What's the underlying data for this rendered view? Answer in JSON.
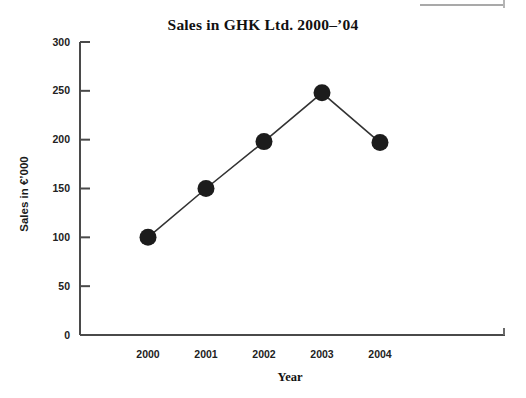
{
  "figure": {
    "background": "#ffffff",
    "ink_color": "#1a1a1a"
  },
  "scan_artifact": {
    "name": "page-edge-rule",
    "color": "#a9a9a9"
  },
  "chart_data": {
    "type": "line",
    "title": "Sales in GHK Ltd. 2000–’04",
    "xlabel": "Year",
    "ylabel": "Sales in €’000",
    "categories": [
      "2000",
      "2001",
      "2002",
      "2003",
      "2004"
    ],
    "values": [
      100,
      150,
      198,
      248,
      197
    ],
    "series": [
      {
        "name": "Sales",
        "values": [
          100,
          150,
          198,
          248,
          197
        ]
      }
    ],
    "ylim": [
      0,
      300
    ],
    "yticks": [
      0,
      50,
      100,
      150,
      200,
      250,
      300
    ],
    "ytick_labels": [
      "0",
      "50",
      "100",
      "150",
      "200",
      "250",
      "300"
    ],
    "xtick_labels": [
      "2000",
      "2001",
      "2002",
      "2003",
      "2004"
    ],
    "grid": false,
    "legend": null,
    "marker": "filled-circle",
    "marker_color": "#1c1c1c",
    "line_color": "#333333",
    "axis_color": "#4a4a4a",
    "tick_direction": "in",
    "annotations": []
  }
}
